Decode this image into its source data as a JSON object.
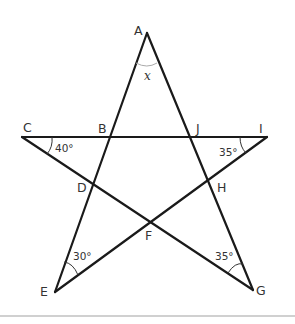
{
  "diagram": {
    "type": "pentagram-geometry",
    "vertices": {
      "A": {
        "label": "A",
        "x": 147,
        "y": 33
      },
      "C": {
        "label": "C",
        "x": 22,
        "y": 137
      },
      "I": {
        "label": "I",
        "x": 267,
        "y": 137
      },
      "E": {
        "label": "E",
        "x": 55,
        "y": 292
      },
      "G": {
        "label": "G",
        "x": 253,
        "y": 290
      }
    },
    "intersections": {
      "B": {
        "label": "B"
      },
      "J": {
        "label": "J"
      },
      "D": {
        "label": "D"
      },
      "H": {
        "label": "H"
      },
      "F": {
        "label": "F"
      }
    },
    "segments": [
      "A-E",
      "A-G",
      "C-I",
      "C-G",
      "I-E"
    ],
    "angles": {
      "A": {
        "label": "x"
      },
      "C": {
        "label": "40°"
      },
      "I": {
        "label": "35°"
      },
      "E": {
        "label": "30°"
      },
      "G": {
        "label": "35°"
      }
    }
  }
}
